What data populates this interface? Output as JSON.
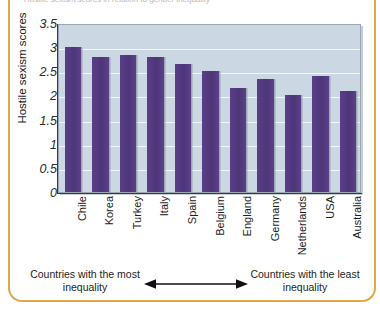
{
  "caption": {
    "text": "Hostile sexism scores in relation to gender inequality"
  },
  "chart_data": {
    "type": "bar",
    "title": "",
    "xlabel": "",
    "ylabel": "Hostile sexism scores",
    "categories": [
      "Chile",
      "Korea",
      "Turkey",
      "Italy",
      "Spain",
      "Belgium",
      "England",
      "Germany",
      "Netherlands",
      "USA",
      "Australia"
    ],
    "values": [
      3.0,
      2.8,
      2.83,
      2.8,
      2.65,
      2.5,
      2.15,
      2.35,
      2.0,
      2.4,
      2.1
    ],
    "ylim": [
      0,
      3.5
    ],
    "ytick_labels": [
      "3.5",
      "3",
      "2.5",
      "2",
      "1.5",
      "1",
      "0.5",
      "0"
    ],
    "ytick_values": [
      3.5,
      3,
      2.5,
      2,
      1.5,
      1,
      0.5,
      0
    ],
    "grid": true,
    "legend": "none",
    "bar_color": "#51387e",
    "plot_background": "#ccd7e4",
    "gridline_color": "#f2f6fa"
  },
  "annotation": {
    "left_label": "Countries with the most inequality",
    "right_label": "Countries with the least inequality",
    "arrow": "double-headed-horizontal-arrow"
  },
  "frame": {
    "accent_color": "#e3a44a"
  }
}
